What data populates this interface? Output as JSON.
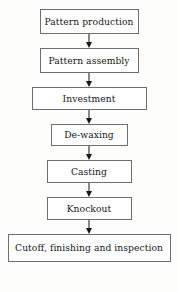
{
  "diagram": {
    "orientation": "top-to-bottom",
    "connector_icon": "down-arrow-icon",
    "colors": {
      "background": "#fdfdfc",
      "box_fill": "#ffffff",
      "box_border": "#6e6e6e",
      "text": "#17171a",
      "arrow": "#17171a"
    },
    "steps": [
      {
        "id": "pattern-production",
        "label": "Pattern production",
        "width_class": "w-pattern"
      },
      {
        "id": "pattern-assembly",
        "label": "Pattern assembly",
        "width_class": "w-pattern"
      },
      {
        "id": "investment",
        "label": "Investment",
        "width_class": "w-investment"
      },
      {
        "id": "de-waxing",
        "label": "De-waxing",
        "width_class": "w-dewaxing"
      },
      {
        "id": "casting",
        "label": "Casting",
        "width_class": "w-casting"
      },
      {
        "id": "knockout",
        "label": "Knockout",
        "width_class": "w-knockout"
      },
      {
        "id": "cutoff-finishing-inspection",
        "label": "Cutoff, finishing and inspection",
        "width_class": "w-cutoff"
      }
    ]
  }
}
